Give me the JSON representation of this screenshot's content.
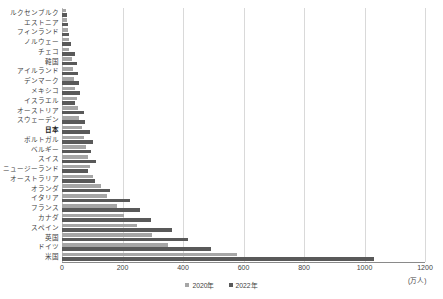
{
  "chart_data": {
    "type": "bar",
    "orientation": "horizontal",
    "title": "",
    "subtitle": "",
    "xlabel": "",
    "ylabel": "",
    "unit_note": "(万人)",
    "xlim": [
      0,
      1200
    ],
    "xticks": [
      0,
      200,
      400,
      600,
      800,
      1000,
      1200
    ],
    "grid": true,
    "grid_axis": "x",
    "legend_position": "bottom-center",
    "highlight_category": "日本",
    "categories": [
      "ルクセンブルク",
      "エストニア",
      "フィンランド",
      "ノルウェー",
      "チェコ",
      "韓国",
      "アイルランド",
      "デンマーク",
      "メキシコ",
      "イスラエル",
      "オーストリア",
      "スウェーデン",
      "日本",
      "ポルトガル",
      "ベルギー",
      "スイス",
      "ニュージーランド",
      "オーストラリア",
      "オランダ",
      "イタリア",
      "フランス",
      "カナダ",
      "スペイン",
      "英国",
      "ドイツ",
      "米国"
    ],
    "series": [
      {
        "name": "2020年",
        "color": "#a6a6a6",
        "values": [
          14,
          16,
          19,
          22,
          24,
          33,
          38,
          41,
          43,
          48,
          52,
          57,
          66,
          72,
          78,
          86,
          93,
          101,
          128,
          148,
          182,
          206,
          248,
          298,
          352,
          578
        ]
      },
      {
        "name": "2022年",
        "color": "#595959",
        "values": [
          17,
          19,
          23,
          30,
          42,
          48,
          52,
          56,
          58,
          42,
          74,
          76,
          92,
          104,
          96,
          112,
          86,
          108,
          160,
          224,
          258,
          294,
          362,
          418,
          492,
          1032
        ]
      }
    ]
  },
  "legend": {
    "items": [
      {
        "label": "2020年",
        "color": "#a6a6a6"
      },
      {
        "label": "2022年",
        "color": "#595959"
      }
    ]
  },
  "axis": {
    "unit": "(万人)",
    "tick_labels": [
      "0",
      "200",
      "400",
      "600",
      "800",
      "1000",
      "1200"
    ]
  }
}
